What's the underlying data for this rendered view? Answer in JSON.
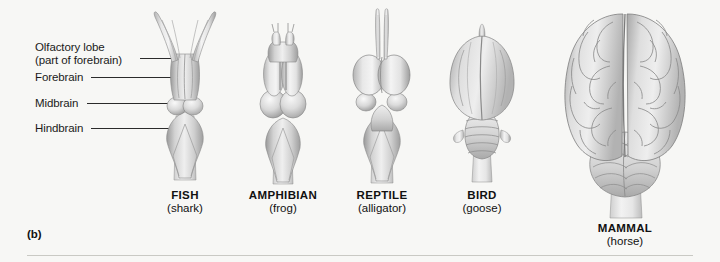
{
  "figure": {
    "panel_letter": "(b)",
    "background_color": "#f7f7f5",
    "line_color": "#2b2b2b",
    "rule_color": "#c9c9c4"
  },
  "callouts": [
    {
      "name": "olfactory-lobe",
      "line1": "Olfactory lobe",
      "line2": "(part of forebrain)"
    },
    {
      "name": "forebrain",
      "line1": "Forebrain",
      "line2": ""
    },
    {
      "name": "midbrain",
      "line1": "Midbrain",
      "line2": ""
    },
    {
      "name": "hindbrain",
      "line1": "Hindbrain",
      "line2": ""
    }
  ],
  "specimens": [
    {
      "key": "fish",
      "common": "FISH",
      "example": "(shark)"
    },
    {
      "key": "amphibian",
      "common": "AMPHIBIAN",
      "example": "(frog)"
    },
    {
      "key": "reptile",
      "common": "REPTILE",
      "example": "(alligator)"
    },
    {
      "key": "bird",
      "common": "BIRD",
      "example": "(goose)"
    },
    {
      "key": "mammal",
      "common": "MAMMAL",
      "example": "(horse)"
    }
  ]
}
